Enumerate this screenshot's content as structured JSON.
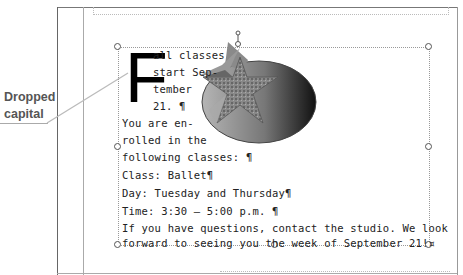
{
  "callout": {
    "line1": "Dropped",
    "line2": "capital"
  },
  "document": {
    "drop_cap": "F",
    "lines": [
      "all classes",
      "start Sep-",
      "tember",
      "21. ¶",
      "You are en-",
      "rolled in the",
      "following classes: ¶",
      "Class: Ballet¶",
      "Day: Tuesday and Thursday¶",
      "Time: 3:30 – 5:00 p.m. ¶",
      "If you have questions, contact the studio. We look",
      "forward to seeing you the week of September 21!¤"
    ]
  },
  "image": {
    "icon": "star-in-oval-image"
  }
}
